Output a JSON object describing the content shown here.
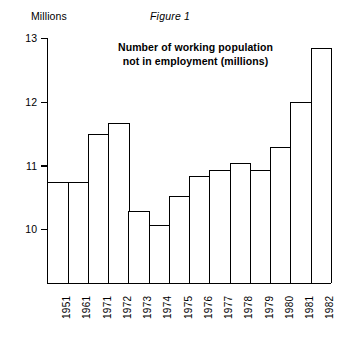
{
  "figure": {
    "caption": "Figure 1",
    "axis_unit_label": "Millions",
    "title_line_1": "Number of working population",
    "title_line_2": "not in employment (millions)",
    "line_color": "#000000",
    "bar_fill_color": "#ffffff",
    "background_color": "#ffffff"
  },
  "chart_data": {
    "type": "bar",
    "title": "Number of working population not in employment (millions)",
    "subtitle": "Figure 1",
    "xlabel": "",
    "ylabel": "Millions",
    "ylim": [
      9.3,
      13
    ],
    "yticks": [
      10,
      11,
      12,
      13
    ],
    "ytick_labels": [
      "10",
      "11",
      "12",
      "13"
    ],
    "grid": false,
    "legend": null,
    "categories": [
      "1951",
      "1961",
      "1971",
      "1972",
      "1973",
      "1974",
      "1975",
      "1976",
      "1977",
      "1978",
      "1979",
      "1980",
      "1981",
      "1982"
    ],
    "values": [
      10.75,
      10.75,
      11.5,
      11.68,
      10.3,
      10.07,
      10.53,
      10.85,
      10.93,
      11.05,
      10.93,
      11.3,
      12.0,
      12.85
    ],
    "units": "millions"
  }
}
